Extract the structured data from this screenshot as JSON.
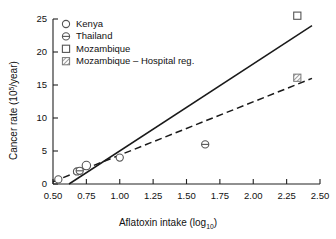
{
  "chart_data": {
    "type": "scatter",
    "title": "",
    "xlabel": "Aflatoxin intake (log10)",
    "xlabel_main": "Aflatoxin intake  (log",
    "xlabel_sub": "10",
    "xlabel_close": ")",
    "ylabel": "Cancer rate (105/year)",
    "ylabel_main": "Cancer rate  (10",
    "ylabel_sup": "5",
    "ylabel_close": "/year)",
    "xlim": [
      0.5,
      2.5
    ],
    "ylim": [
      0,
      25
    ],
    "grid": false,
    "legend_position": "top-left",
    "xticks": [
      "0.50",
      "0.75",
      "1.00",
      "1.25",
      "1.50",
      "1.75",
      "2.00",
      "2.25",
      "2.50"
    ],
    "xtick_values": [
      0.5,
      0.75,
      1.0,
      1.25,
      1.5,
      1.75,
      2.0,
      2.25,
      2.5
    ],
    "yticks": [
      "0",
      "5",
      "10",
      "15",
      "20",
      "25"
    ],
    "ytick_values": [
      0,
      5,
      10,
      15,
      20,
      25
    ],
    "series": [
      {
        "name": "Kenya",
        "marker": "open-circle",
        "points": [
          {
            "x": 0.54,
            "y": 0.7
          },
          {
            "x": 0.68,
            "y": 1.9
          },
          {
            "x": 0.75,
            "y": 2.8
          },
          {
            "x": 1.0,
            "y": 4.0
          }
        ]
      },
      {
        "name": "Thailand",
        "marker": "barred-circle",
        "points": [
          {
            "x": 0.7,
            "y": 2.0
          },
          {
            "x": 1.64,
            "y": 6.0
          }
        ]
      },
      {
        "name": "Mozambique",
        "marker": "open-square",
        "points": [
          {
            "x": 2.33,
            "y": 25.5
          }
        ]
      },
      {
        "name": "Mozambique - Hospital reg.",
        "marker": "hatched-square",
        "points": [
          {
            "x": 2.33,
            "y": 16.1
          }
        ]
      }
    ],
    "fit_lines": [
      {
        "name": "solid-regression-line",
        "style": "solid",
        "x0": 0.62,
        "y0": 0.0,
        "x1": 2.44,
        "y1": 24.0
      },
      {
        "name": "dashed-regression-line",
        "style": "dashed",
        "x0": 0.5,
        "y0": 0.35,
        "x1": 2.44,
        "y1": 16.0
      }
    ]
  },
  "legend": {
    "items": [
      {
        "label": "Kenya",
        "marker": "open-circle"
      },
      {
        "label": "Thailand",
        "marker": "barred-circle"
      },
      {
        "label": "Mozambique",
        "marker": "open-square"
      },
      {
        "label": "Mozambique – Hospital reg.",
        "marker": "hatched-square"
      }
    ]
  }
}
